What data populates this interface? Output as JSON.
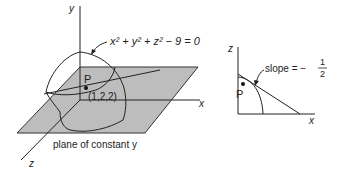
{
  "figure": {
    "left_panel": {
      "axis_labels": {
        "y": "y",
        "x": "x",
        "z": "z"
      },
      "surface_equation": {
        "base": "x",
        "parts": [
          "x",
          "2",
          " + ",
          "y",
          "2",
          " + ",
          "z",
          "2",
          " − 9 = 0"
        ]
      },
      "equation_text": "x² + y² + z² − 9 = 0",
      "point_label": "P",
      "point_coords": "(1,2,2)",
      "plane_caption": "plane of constant y",
      "colors": {
        "plane_fill": "#bdbdbd",
        "line": "#222222"
      }
    },
    "right_panel": {
      "axis_labels": {
        "z": "z",
        "x": "x"
      },
      "point_label": "P",
      "slope_label": "slope = −",
      "slope_numerator": "1",
      "slope_denominator": "2"
    }
  }
}
